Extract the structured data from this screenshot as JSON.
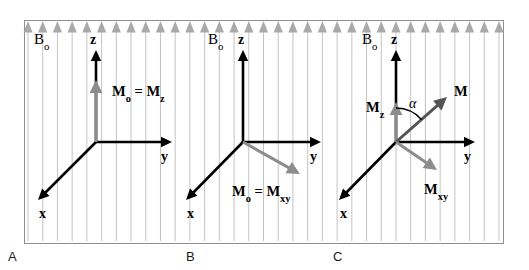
{
  "figure": {
    "background_color": "#ffffff",
    "frame": {
      "x": 24,
      "y": 20,
      "width": 479,
      "height": 223,
      "border_color": "#8f8f8f",
      "border_width": 1
    },
    "field": {
      "label": "B0",
      "label_text": "B",
      "label_sub": "o",
      "line_color": "#b9b9b9",
      "arrow_color": "#a8a8a8",
      "line_count": 33,
      "line_spacing": 14.5,
      "description": "vertical field lines with upward triangular arrowheads along the top edge"
    },
    "colors": {
      "axis": "#000000",
      "magnetization_gray": "#8c8c8c",
      "magnetization_dark": "#555555",
      "text": "#000000",
      "frame": "#8f8f8f",
      "field_line": "#bcbcbc",
      "field_arrow": "#a9a9a9"
    },
    "panels": [
      {
        "id": "A",
        "letter": "A",
        "letter_x": 8,
        "letter_y": 250,
        "origin": {
          "x": 96,
          "y": 142
        },
        "field_label": {
          "text": "B",
          "sub": "o",
          "x": 34,
          "y": 44
        },
        "axes": [
          {
            "name": "z",
            "label": "z",
            "sub": "",
            "tip": {
              "x": 96,
              "y": 50
            },
            "label_pos": {
              "x": 90,
              "y": 44
            }
          },
          {
            "name": "y",
            "label": "y",
            "sub": "",
            "tip": {
              "x": 172,
              "y": 142
            },
            "label_pos": {
              "x": 161,
              "y": 161
            }
          },
          {
            "name": "x",
            "label": "x",
            "sub": "",
            "tip": {
              "x": 38,
              "y": 200
            },
            "label_pos": {
              "x": 39,
              "y": 218
            }
          }
        ],
        "vectors": [
          {
            "name": "M0 = Mz",
            "label_main": "M",
            "label_sub": "o",
            "label_eq": " = M",
            "label_sub2": "z",
            "color": "#8c8c8c",
            "from": {
              "x": 96,
              "y": 142
            },
            "to": {
              "x": 96,
              "y": 80
            },
            "label_pos": {
              "x": 112,
              "y": 96
            }
          }
        ],
        "angle_arc": null
      },
      {
        "id": "B",
        "letter": "B",
        "letter_x": 186,
        "letter_y": 250,
        "origin": {
          "x": 243,
          "y": 142
        },
        "field_label": {
          "text": "B",
          "sub": "o",
          "x": 208,
          "y": 44
        },
        "axes": [
          {
            "name": "z",
            "label": "z",
            "sub": "",
            "tip": {
              "x": 243,
              "y": 50
            },
            "label_pos": {
              "x": 238,
              "y": 44
            }
          },
          {
            "name": "y",
            "label": "y",
            "sub": "",
            "tip": {
              "x": 321,
              "y": 142
            },
            "label_pos": {
              "x": 310,
              "y": 161
            }
          },
          {
            "name": "x",
            "label": "x",
            "sub": "",
            "tip": {
              "x": 186,
              "y": 200
            },
            "label_pos": {
              "x": 187,
              "y": 218
            }
          }
        ],
        "vectors": [
          {
            "name": "M0 = Mxy",
            "label_main": "M",
            "label_sub": "o",
            "label_eq": " = M",
            "label_sub2": "xy",
            "color": "#8c8c8c",
            "from": {
              "x": 243,
              "y": 142
            },
            "to": {
              "x": 300,
              "y": 174
            },
            "label_pos": {
              "x": 232,
              "y": 196
            }
          }
        ],
        "angle_arc": null
      },
      {
        "id": "C",
        "letter": "C",
        "letter_x": 333,
        "letter_y": 250,
        "origin": {
          "x": 396,
          "y": 142
        },
        "field_label": {
          "text": "B",
          "sub": "o",
          "x": 362,
          "y": 44
        },
        "axes": [
          {
            "name": "z",
            "label": "z",
            "sub": "",
            "tip": {
              "x": 396,
              "y": 50
            },
            "label_pos": {
              "x": 391,
              "y": 44
            }
          },
          {
            "name": "y",
            "label": "y",
            "sub": "",
            "tip": {
              "x": 475,
              "y": 142
            },
            "label_pos": {
              "x": 464,
              "y": 161
            }
          },
          {
            "name": "x",
            "label": "x",
            "sub": "",
            "tip": {
              "x": 339,
              "y": 200
            },
            "label_pos": {
              "x": 340,
              "y": 218
            }
          }
        ],
        "vectors": [
          {
            "name": "Mz",
            "label_main": "M",
            "label_sub": "z",
            "label_eq": "",
            "label_sub2": "",
            "color": "#8c8c8c",
            "from": {
              "x": 396,
              "y": 142
            },
            "to": {
              "x": 396,
              "y": 102
            },
            "label_pos": {
              "x": 366,
              "y": 112
            }
          },
          {
            "name": "M",
            "label_main": "M",
            "label_sub": "",
            "label_eq": "",
            "label_sub2": "",
            "color": "#555555",
            "from": {
              "x": 396,
              "y": 142
            },
            "to": {
              "x": 447,
              "y": 97
            },
            "label_pos": {
              "x": 454,
              "y": 96
            }
          },
          {
            "name": "Mxy",
            "label_main": "M",
            "label_sub": "xy",
            "label_eq": "",
            "label_sub2": "",
            "color": "#8c8c8c",
            "from": {
              "x": 396,
              "y": 142
            },
            "to": {
              "x": 437,
              "y": 170
            },
            "label_pos": {
              "x": 424,
              "y": 194
            }
          }
        ],
        "angle_arc": {
          "label": "α",
          "label_pos": {
            "x": 409,
            "y": 108
          },
          "center": {
            "x": 396,
            "y": 142
          },
          "radius": 34,
          "start_angle_deg": 90,
          "end_angle_deg": 41
        }
      }
    ]
  }
}
